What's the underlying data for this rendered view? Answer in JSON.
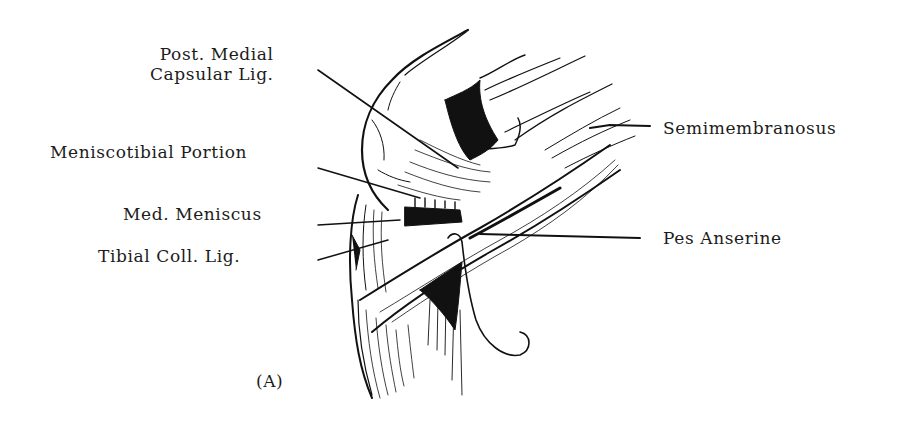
{
  "figure": {
    "panel_label": "(A)",
    "ink_color": "#111111",
    "background_color": "#ffffff",
    "labels_left": [
      {
        "id": "post-medial-capsular-lig",
        "lines": [
          "Post. Medial",
          "Capsular Lig."
        ]
      },
      {
        "id": "meniscotibial-portion",
        "text": "Meniscotibial Portion"
      },
      {
        "id": "med-meniscus",
        "text": "Med.  Meniscus"
      },
      {
        "id": "tibial-coll-lig",
        "text": "Tibial Coll.  Lig."
      }
    ],
    "labels_right": [
      {
        "id": "semimembranosus",
        "text": "Semimembranosus"
      },
      {
        "id": "pes-anserine",
        "text": "Pes Anserine"
      }
    ]
  }
}
